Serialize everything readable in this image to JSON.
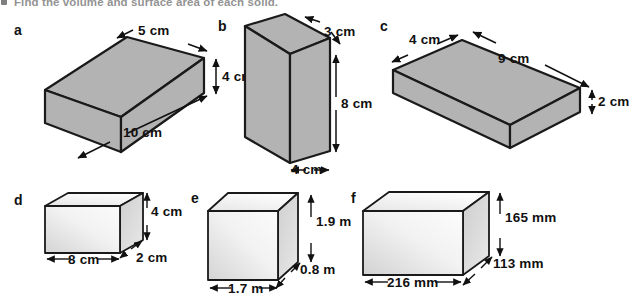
{
  "prompt": {
    "bullet": "3",
    "text": "Find the volume and surface area of each solid."
  },
  "figures": [
    {
      "id": "a",
      "label": "a",
      "unit": "cm",
      "dimensions": [
        {
          "name": "depth",
          "value": "5 cm"
        },
        {
          "name": "height",
          "value": "4 cm"
        },
        {
          "name": "width",
          "value": "10 cm"
        }
      ],
      "fill": "#b3b3b3",
      "style": "flat-gray"
    },
    {
      "id": "b",
      "label": "b",
      "unit": "cm",
      "dimensions": [
        {
          "name": "depth",
          "value": "3 cm"
        },
        {
          "name": "height",
          "value": "8 cm"
        },
        {
          "name": "width",
          "value": "4 cm"
        }
      ],
      "fill": "#b3b3b3",
      "style": "flat-gray"
    },
    {
      "id": "c",
      "label": "c",
      "unit": "cm",
      "dimensions": [
        {
          "name": "depth",
          "value": "4 cm"
        },
        {
          "name": "length",
          "value": "9 cm"
        },
        {
          "name": "height",
          "value": "2 cm"
        }
      ],
      "fill": "#b3b3b3",
      "style": "flat-gray"
    },
    {
      "id": "d",
      "label": "d",
      "unit": "cm",
      "dimensions": [
        {
          "name": "height",
          "value": "4 cm"
        },
        {
          "name": "width",
          "value": "8 cm"
        },
        {
          "name": "depth",
          "value": "2 cm"
        }
      ],
      "fill": "#e9e9e9",
      "style": "gradient-light"
    },
    {
      "id": "e",
      "label": "e",
      "unit": "m",
      "dimensions": [
        {
          "name": "height",
          "value": "1.9 m"
        },
        {
          "name": "depth",
          "value": "0.8 m"
        },
        {
          "name": "width",
          "value": "1.7 m"
        }
      ],
      "fill": "#e9e9e9",
      "style": "gradient-light"
    },
    {
      "id": "f",
      "label": "f",
      "unit": "mm",
      "dimensions": [
        {
          "name": "height",
          "value": "165 mm"
        },
        {
          "name": "depth",
          "value": "113 mm"
        },
        {
          "name": "width",
          "value": "216 mm"
        }
      ],
      "fill": "#e9e9e9",
      "style": "gradient-light"
    }
  ],
  "colors": {
    "solid_gray": "#b3b3b3",
    "solid_light": "#efefef",
    "outline": "#1a1a1a",
    "background": "#ffffff",
    "text": "#111111"
  }
}
